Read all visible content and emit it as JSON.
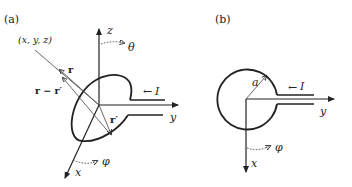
{
  "figure": {
    "panel_a": {
      "label": "(a)",
      "point_label": "(x, y, z)",
      "vector_r": "r",
      "vector_r_minus_r_prime": "r − r′",
      "vector_r_prime": "r′",
      "axis_z": "z",
      "axis_y": "y",
      "axis_x": "x",
      "angle_theta": "θ",
      "angle_phi": "φ",
      "current": "I",
      "current_arrow": "←"
    },
    "panel_b": {
      "label": "(b)",
      "radius": "a",
      "axis_y": "y",
      "axis_x": "x",
      "angle_phi": "φ",
      "current": "I",
      "current_arrow": "←"
    }
  }
}
